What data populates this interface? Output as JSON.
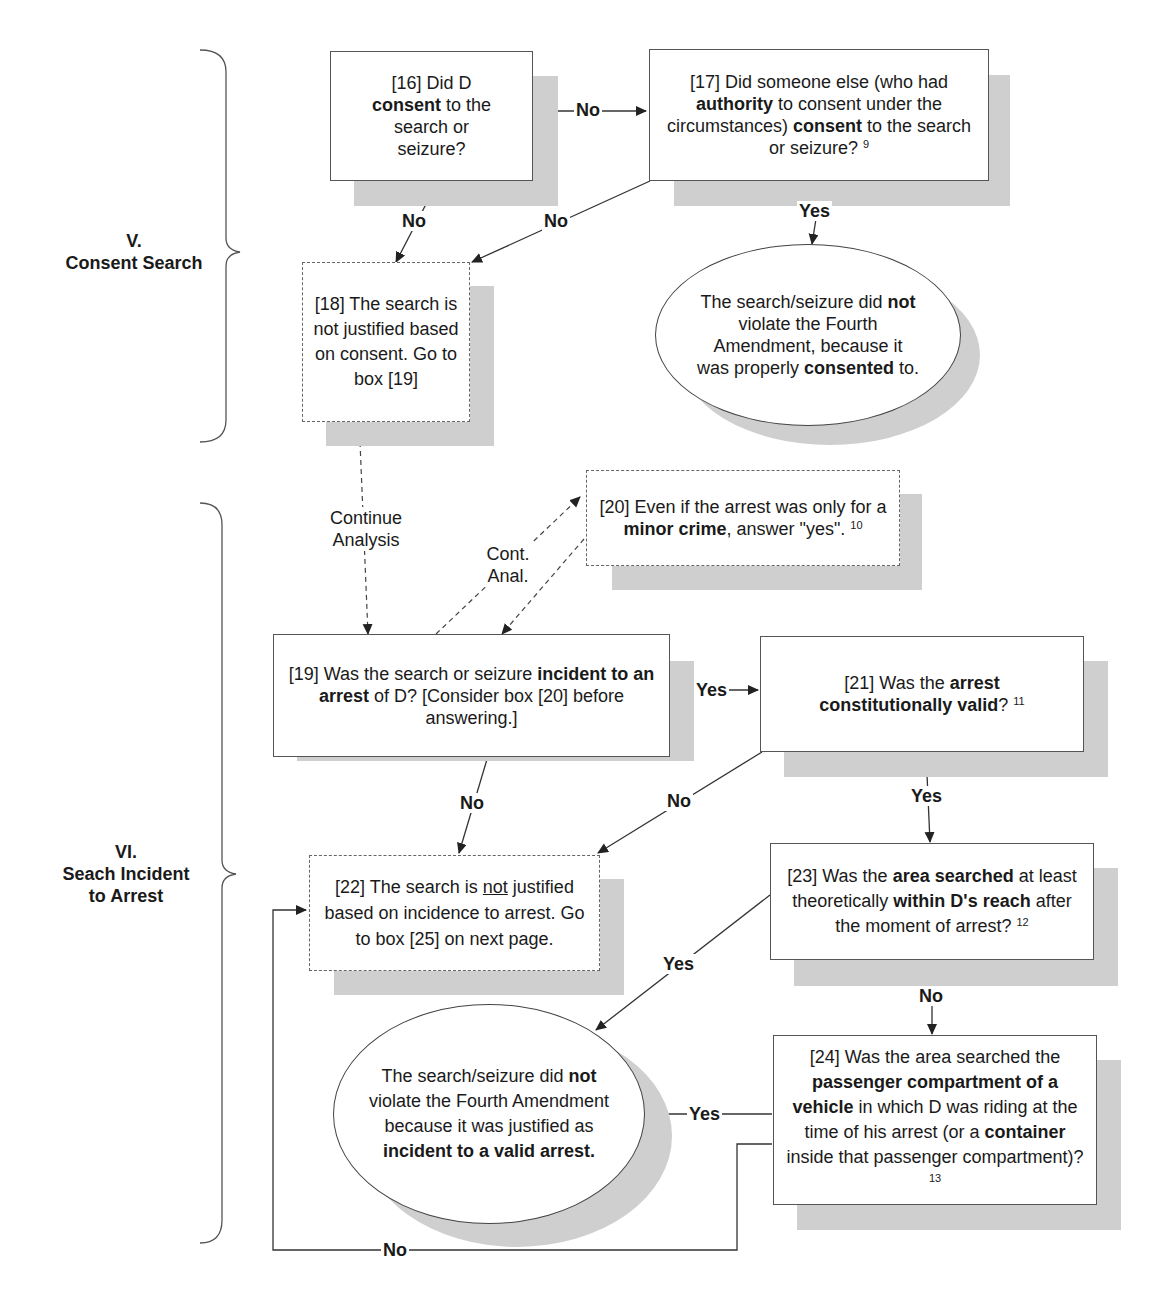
{
  "sections": [
    {
      "id": "V",
      "numeral": "V.",
      "title": "Consent Search"
    },
    {
      "id": "VI",
      "numeral": "VI.",
      "title_line1": "Seach Incident",
      "title_line2": "to Arrest"
    }
  ],
  "nodes": {
    "box16": {
      "pre": "[16] Did D ",
      "bold": "consent",
      "post": " to the search or seizure?"
    },
    "box17": {
      "pre": "[17] Did someone else (who had ",
      "bold1": "authority",
      "mid": " to consent under the circumstances) ",
      "bold2": "consent",
      "post": "  to the search or seizure? ",
      "footnote": "9"
    },
    "box18": {
      "text": "[18] The search is not justified based on consent. Go to box [19]"
    },
    "outcome_consent": {
      "pre": "The search/seizure did ",
      "bold1": "not",
      "mid": " violate the Fourth Amendment, because it was properly ",
      "bold2": "consented",
      "post": " to."
    },
    "box20": {
      "pre": "[20] Even if the arrest was only for a ",
      "bold": "minor crime",
      "post": ", answer \"yes\". ",
      "footnote": "10"
    },
    "box19": {
      "pre": "[19] Was the search or seizure ",
      "bold": "incident to an arrest",
      "post": " of D? [Consider box [20] before answering.]"
    },
    "box21": {
      "pre": "[21] Was the ",
      "bold": "arrest constitutionally valid",
      "post": "? ",
      "footnote": "11"
    },
    "box22": {
      "pre": "[22] The search is ",
      "underline": "not",
      "post": " justified based on incidence to arrest. Go to box [25] on next page."
    },
    "box23": {
      "pre": "[23] Was the ",
      "bold1": "area searched",
      "mid1": " at least theoretically ",
      "bold2": "within D's reach",
      "post": " after the moment of arrest? ",
      "footnote": "12"
    },
    "box24": {
      "pre": "[24] Was the area searched the ",
      "bold1": "passenger compartment of a vehicle",
      "mid": " in which D was riding at the time of his arrest (or a ",
      "bold2": "container",
      "post": " inside that passenger compartment)? ",
      "footnote": "13"
    },
    "outcome_arrest": {
      "pre": "The search/seizure did ",
      "bold1": "not",
      "mid": " violate the Fourth Amendment because it was justified as ",
      "bold2": "incident to a valid arrest."
    }
  },
  "edge_labels": {
    "e16_17": "No",
    "e16_18": "No",
    "e17_18": "No",
    "e17_yes": "Yes",
    "e18_19_line1": "Continue",
    "e18_19_line2": "Analysis",
    "e19_20_line1": "Cont.",
    "e19_20_line2": "Anal.",
    "e19_21": "Yes",
    "e19_22": "No",
    "e21_22": "No",
    "e21_23": "Yes",
    "e23_yes": "Yes",
    "e23_24": "No",
    "e24_yes": "Yes",
    "e24_no": "No"
  },
  "colors": {
    "line": "#444444",
    "shadow": "#cfcfcf",
    "box_border": "#555555"
  }
}
